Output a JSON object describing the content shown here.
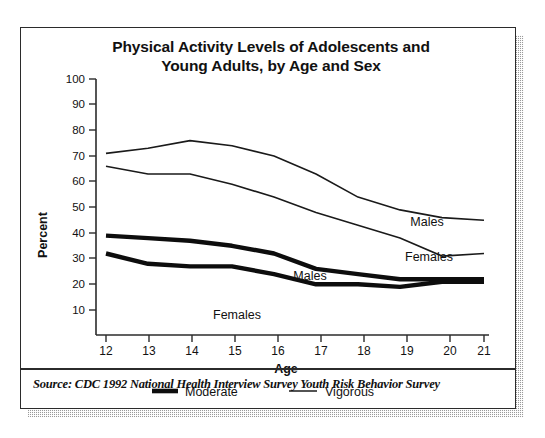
{
  "figure": {
    "title_line1": "Physical Activity Levels of Adolescents and",
    "title_line2": "Young Adults, by Age and Sex",
    "source": "Source: CDC 1992 National Health Interview Survey Youth Risk Behavior Survey",
    "frame_color": "#2b2b2b",
    "ink_color": "#111111",
    "background_color": "#ffffff"
  },
  "chart_data": {
    "type": "line",
    "title": "Physical Activity Levels of Adolescents and Young Adults, by Age and Sex",
    "xlabel": "Age",
    "ylabel": "Percent",
    "x": [
      12,
      13,
      14,
      15,
      16,
      17,
      18,
      19,
      20,
      21
    ],
    "xlim": [
      12,
      21
    ],
    "ylim": [
      0,
      100
    ],
    "ytick_labels": [
      "100",
      "90",
      "80",
      "70",
      "60",
      "50",
      "40",
      "30",
      "20",
      "10"
    ],
    "yticks": [
      100,
      90,
      80,
      70,
      60,
      50,
      40,
      30,
      20,
      10
    ],
    "xtick_labels": [
      "12",
      "13",
      "14",
      "15",
      "16",
      "17",
      "18",
      "19",
      "20",
      "21"
    ],
    "grid": false,
    "legend_position": "below-axis",
    "series": [
      {
        "name": "Vigorous Males",
        "activity": "Vigorous",
        "sex": "Males",
        "style": "thin",
        "inline_label": "Males",
        "values": [
          71,
          73,
          76,
          74,
          70,
          63,
          54,
          49,
          46,
          45
        ]
      },
      {
        "name": "Vigorous Females",
        "activity": "Vigorous",
        "sex": "Females",
        "style": "thin",
        "inline_label": "Females",
        "values": [
          66,
          63,
          63,
          59,
          54,
          48,
          43,
          38,
          31,
          32
        ]
      },
      {
        "name": "Moderate Males",
        "activity": "Moderate",
        "sex": "Males",
        "style": "thick",
        "inline_label": "Males",
        "values": [
          39,
          38,
          37,
          35,
          32,
          26,
          24,
          22,
          22,
          22
        ]
      },
      {
        "name": "Moderate Females",
        "activity": "Moderate",
        "sex": "Females",
        "style": "thick",
        "inline_label": "Females",
        "values": [
          32,
          28,
          27,
          27,
          24,
          20,
          20,
          19,
          21,
          21
        ]
      }
    ],
    "legend": [
      {
        "label": "Moderate",
        "style": "thick"
      },
      {
        "label": "Vigorous",
        "style": "thin"
      }
    ]
  }
}
